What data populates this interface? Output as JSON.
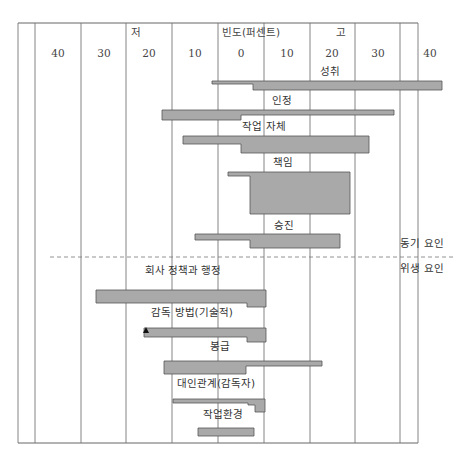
{
  "chart_data": {
    "type": "bar",
    "orientation": "horizontal-diverging",
    "title": "",
    "axis_title": "빈도(퍼센트)",
    "low_label": "저",
    "high_label": "고",
    "ticks": [
      {
        "label": "40",
        "x": 58
      },
      {
        "label": "30",
        "x": 104
      },
      {
        "label": "20",
        "x": 149
      },
      {
        "label": "10",
        "x": 195
      },
      {
        "label": "0",
        "x": 241
      },
      {
        "label": "10",
        "x": 287
      },
      {
        "label": "20",
        "x": 332
      },
      {
        "label": "30",
        "x": 378
      },
      {
        "label": "40",
        "x": 430
      }
    ],
    "gridlines_x": [
      18,
      35,
      81,
      126,
      172,
      218,
      264,
      310,
      355,
      400,
      418
    ],
    "frame": {
      "left": 18,
      "top": 23,
      "right": 418,
      "bottom": 443
    },
    "divider": {
      "y": 257,
      "x1": 50,
      "x2": 455
    },
    "groups": [
      {
        "name": "동기 요인",
        "x": 422,
        "y": 247
      },
      {
        "name": "위생 요인",
        "x": 422,
        "y": 272
      }
    ],
    "series": [
      {
        "name": "성취",
        "group": "동기 요인",
        "low_pct": -5,
        "high_pct": 40,
        "label_pos": [
          330,
          75
        ],
        "points": "212,81 442,81 442,90 253,90 253,84 212,84"
      },
      {
        "name": "인정",
        "group": "동기 요인",
        "low_pct": -17,
        "high_pct": 33,
        "label_pos": [
          282,
          104
        ],
        "points": "162,110 394,110 394,115 241,115 241,120 162,120"
      },
      {
        "name": "작업 자체",
        "group": "동기 요인",
        "low_pct": -13,
        "high_pct": 28,
        "label_pos": [
          264,
          130
        ],
        "points": "183,136 369,136 369,153 241,153 241,144 183,144"
      },
      {
        "name": "책임",
        "group": "동기 요인",
        "low_pct": -3,
        "high_pct": 23,
        "label_pos": [
          283,
          166
        ],
        "points": "228,172 350,172 350,214 250,214 250,176 228,176"
      },
      {
        "name": "승진",
        "group": "동기 요인",
        "low_pct": -10,
        "high_pct": 21,
        "label_pos": [
          284,
          229
        ],
        "points": "195,234 340,234 340,248 250,248 250,240 195,240"
      },
      {
        "name": "회사 정책과 행정",
        "group": "위생 요인",
        "low_pct": -31,
        "high_pct": 5,
        "label_pos": [
          183,
          274
        ],
        "points": "96,290 266,290 266,307 247,307 247,303 96,303"
      },
      {
        "name": "감독 방법(기술적)",
        "group": "위생 요인",
        "low_pct": -20,
        "high_pct": 5,
        "label_pos": [
          192,
          316
        ],
        "points": "144,328 266,328 266,342 247,342 247,337 144,337"
      },
      {
        "name": "봉급",
        "group": "위생 요인",
        "low_pct": -17,
        "high_pct": 18,
        "label_pos": [
          220,
          350
        ],
        "points": "164,361 322,361 322,366 246,366 246,374 164,374"
      },
      {
        "name": "대인관계(감독자)",
        "group": "위생 요인",
        "low_pct": -15,
        "high_pct": 5,
        "label_pos": [
          216,
          387
        ],
        "points": "173,399 265,399 265,412 255,412 255,405 248,405 248,403 173,403"
      },
      {
        "name": "작업환경",
        "group": "위생 요인",
        "low_pct": -10,
        "high_pct": 3,
        "label_pos": [
          223,
          418
        ],
        "points": "198,428 254,428 254,436 198,436"
      }
    ],
    "annotations": [
      {
        "type": "triangle-marker",
        "series": "감독 방법(기술적)",
        "x": 146,
        "y": 330
      }
    ],
    "xlabel": "빈도(퍼센트)",
    "ylabel": "",
    "grid": true,
    "legend_position": "right (group labels)"
  }
}
